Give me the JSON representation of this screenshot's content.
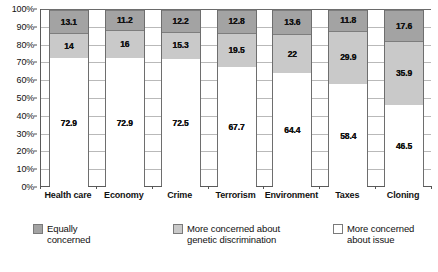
{
  "chart_data": {
    "type": "bar",
    "stacked": true,
    "title": "",
    "subtitle": "",
    "xlabel": "",
    "ylabel": "",
    "ylim": [
      0,
      100
    ],
    "y_unit": "%",
    "grid": true,
    "legend_position": "bottom-left",
    "categories": [
      "Health care",
      "Economy",
      "Crime",
      "Terrorism",
      "Environment",
      "Taxes",
      "Cloning"
    ],
    "y_ticks": [
      "0%",
      "10%",
      "20%",
      "30%",
      "40%",
      "50%",
      "60%",
      "70%",
      "80%",
      "90%",
      "100%"
    ],
    "y_tick_values": [
      0,
      10,
      20,
      30,
      40,
      50,
      60,
      70,
      80,
      90,
      100
    ],
    "series": [
      {
        "name": "More concerned about issue",
        "color": "#ffffff",
        "values": [
          72.9,
          72.9,
          72.5,
          67.7,
          64.4,
          58.4,
          46.5
        ],
        "labels": [
          "72.9",
          "72.9",
          "72.5",
          "67.7",
          "64.4",
          "58.4",
          "46.5"
        ]
      },
      {
        "name": "More concerned about genetic discrimination",
        "color": "#c9c9c9",
        "values": [
          14,
          16,
          15.3,
          19.5,
          22,
          29.9,
          35.9
        ],
        "labels": [
          "14",
          "16",
          "15.3",
          "19.5",
          "22",
          "29.9",
          "35.9"
        ]
      },
      {
        "name": "Equally concerned",
        "color": "#a3a3a3",
        "values": [
          13.1,
          11.2,
          12.2,
          12.8,
          13.6,
          11.8,
          17.6
        ],
        "labels": [
          "13.1",
          "11.2",
          "12.2",
          "12.8",
          "13.6",
          "11.8",
          "17.6"
        ]
      }
    ]
  },
  "legend": {
    "items": [
      {
        "label": "Equally concerned",
        "swatch": "dark"
      },
      {
        "label": "More concerned about genetic discrimination",
        "swatch": "mid"
      },
      {
        "label": "More concerned about issue",
        "swatch": "light"
      }
    ]
  }
}
